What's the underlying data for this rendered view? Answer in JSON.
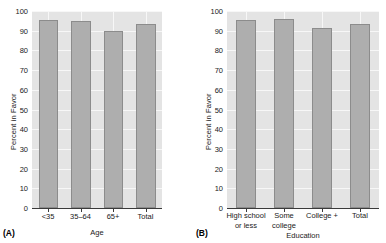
{
  "figure": {
    "background": "#ffffff",
    "plot_background": "#e4e4e4",
    "bar_fill": "#aeaeae",
    "bar_border": "#8c8c8c",
    "grid_color": "#f7f7f7"
  },
  "panels": [
    {
      "tag": "(A)",
      "ylabel": "Percent in Favor",
      "xlabel": "Age",
      "yticks": [
        "0",
        "10",
        "20",
        "30",
        "40",
        "50",
        "60",
        "70",
        "80",
        "90",
        "100"
      ],
      "categories": [
        "<35",
        "35–64",
        "65+",
        "Total"
      ],
      "category_lines": [
        [
          "<35"
        ],
        [
          "35–64"
        ],
        [
          "65+"
        ],
        [
          "Total"
        ]
      ],
      "values": [
        95.5,
        95.0,
        90.0,
        93.5
      ]
    },
    {
      "tag": "(B)",
      "ylabel": "Percent in Favor",
      "xlabel": "Education",
      "yticks": [
        "0",
        "10",
        "20",
        "30",
        "40",
        "50",
        "60",
        "70",
        "80",
        "90",
        "100"
      ],
      "categories": [
        "High school or less",
        "Some college",
        "College +",
        "Total"
      ],
      "category_lines": [
        [
          "High school",
          "or less"
        ],
        [
          "Some",
          "college"
        ],
        [
          "College +"
        ],
        [
          "Total"
        ]
      ],
      "values": [
        95.5,
        96.0,
        91.5,
        93.5
      ]
    }
  ],
  "chart_data": [
    {
      "type": "bar",
      "title": "",
      "panel": "(A)",
      "categories": [
        "<35",
        "35–64",
        "65+",
        "Total"
      ],
      "values": [
        95.5,
        95.0,
        90.0,
        93.5
      ],
      "xlabel": "Age",
      "ylabel": "Percent in Favor",
      "ylim": [
        0,
        100
      ],
      "ytick_step": 10,
      "grid": true,
      "legend": "none"
    },
    {
      "type": "bar",
      "title": "",
      "panel": "(B)",
      "categories": [
        "High school or less",
        "Some college",
        "College +",
        "Total"
      ],
      "values": [
        95.5,
        96.0,
        91.5,
        93.5
      ],
      "xlabel": "Education",
      "ylabel": "Percent in Favor",
      "ylim": [
        0,
        100
      ],
      "ytick_step": 10,
      "grid": true,
      "legend": "none"
    }
  ]
}
